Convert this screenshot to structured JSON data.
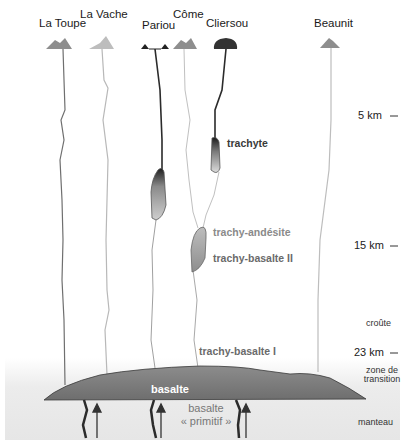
{
  "volcanoes": [
    {
      "name": "La Toupe",
      "x": 63,
      "label_y": 12,
      "cone_color": "#8e8e8e"
    },
    {
      "name": "La Vache",
      "x": 100,
      "label_y": 4,
      "cone_color": "#b8b8b8"
    },
    {
      "name": "Pariou",
      "x": 158,
      "label_y": 15,
      "cone_color": "#2a2a2a"
    },
    {
      "name": "Côme",
      "x": 184,
      "label_y": 4,
      "cone_color": "#8e8e8e"
    },
    {
      "name": "Cliersou",
      "x": 226,
      "label_y": 12,
      "cone_color": "#333333"
    },
    {
      "name": "Beaunit",
      "x": 329,
      "label_y": 12,
      "cone_color": "#8e8e8e"
    }
  ],
  "rock_labels": {
    "trachyte": "trachyte",
    "trachy_andesite": "trachy-andésite",
    "trachy_basalte_2": "trachy-basalte II",
    "trachy_basalte_1": "trachy-basalte I",
    "basalte": "basalte",
    "basalte_primitif_line1": "basalte",
    "basalte_primitif_line2": "« primitif »"
  },
  "depth_scale": [
    {
      "label": "5 km",
      "y": 115
    },
    {
      "label": "15 km",
      "y": 245
    },
    {
      "label": "23 km",
      "y": 352
    }
  ],
  "zones": {
    "croute": "croûte",
    "zone_transition_line1": "zone de",
    "zone_transition_line2": "transition",
    "manteau": "manteau"
  },
  "colors": {
    "mantle_bg": "#e9e9e9",
    "basalt_body": "#7a7a7a",
    "dark_conduit": "#2b2b2b",
    "grey_conduit": "#b5b5b5"
  }
}
